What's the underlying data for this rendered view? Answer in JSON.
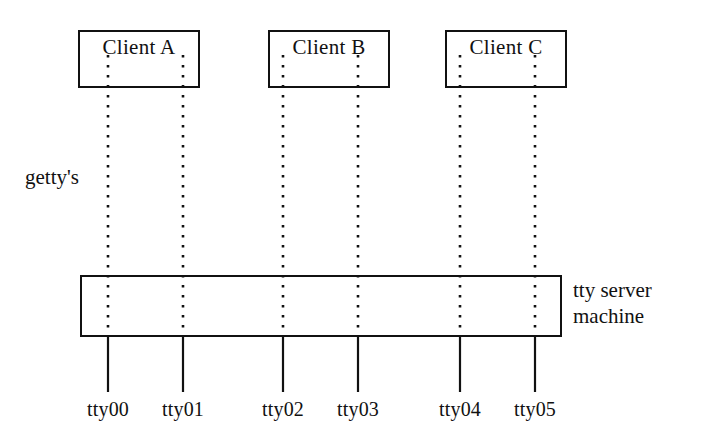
{
  "diagram": {
    "canvas": {
      "width": 709,
      "height": 444,
      "background": "#ffffff"
    },
    "ink_color": "#111111",
    "clients": [
      {
        "id": "client-a",
        "label": "Client A",
        "box": {
          "x": 78,
          "y": 30,
          "width": 122,
          "height": 58
        },
        "ports": [
          "tty00",
          "tty01"
        ]
      },
      {
        "id": "client-b",
        "label": "Client B",
        "box": {
          "x": 268,
          "y": 30,
          "width": 122,
          "height": 58
        },
        "ports": [
          "tty02",
          "tty03"
        ]
      },
      {
        "id": "client-c",
        "label": "Client C",
        "box": {
          "x": 445,
          "y": 30,
          "width": 122,
          "height": 58
        },
        "ports": [
          "tty04",
          "tty05"
        ]
      }
    ],
    "server": {
      "id": "tty-server",
      "label_line_1": "tty server",
      "label_line_2": "machine",
      "box": {
        "x": 80,
        "y": 275,
        "width": 482,
        "height": 62
      },
      "label_x": 573,
      "label_y": 278
    },
    "getty": {
      "label": "getty's",
      "x": 25,
      "y": 165
    },
    "ports": [
      {
        "name": "tty00",
        "x": 108
      },
      {
        "name": "tty01",
        "x": 183
      },
      {
        "name": "tty02",
        "x": 283
      },
      {
        "name": "tty03",
        "x": 358
      },
      {
        "name": "tty04",
        "x": 460
      },
      {
        "name": "tty05",
        "x": 535
      }
    ],
    "geometry": {
      "dotted_top_y": 55,
      "dotted_bottom_y": 337,
      "solid_line_top_y": 337,
      "solid_line_bottom_y": 392,
      "port_label_y": 398
    }
  }
}
